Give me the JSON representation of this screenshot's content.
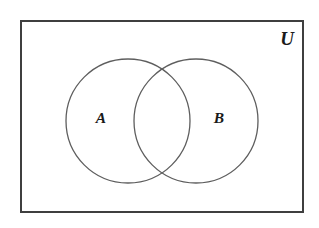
{
  "figure": {
    "kind": "venn-diagram",
    "background_color": "#ffffff"
  },
  "universe": {
    "label": "U",
    "label_x": 287,
    "label_y": 41,
    "rect": {
      "x": 21,
      "y": 21,
      "width": 282,
      "height": 191
    },
    "stroke_color": "#3f3f3f",
    "stroke_width": 2,
    "fill": "none"
  },
  "sets": [
    {
      "id": "set-a",
      "label": "A",
      "label_x": 101,
      "label_y": 119,
      "cx": 128,
      "cy": 121,
      "r": 62,
      "stroke_color": "#5e5e5e",
      "stroke_width": 1.3,
      "fill": "none"
    },
    {
      "id": "set-b",
      "label": "B",
      "label_x": 219,
      "label_y": 119,
      "cx": 196,
      "cy": 121,
      "r": 62,
      "stroke_color": "#5e5e5e",
      "stroke_width": 1.3,
      "fill": "none"
    }
  ],
  "regions": {
    "intersection_label": "",
    "complement_label": ""
  }
}
